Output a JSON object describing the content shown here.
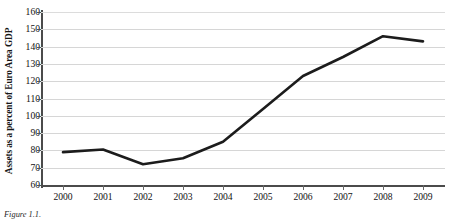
{
  "chart_data": {
    "type": "line",
    "title": "",
    "xlabel": "",
    "ylabel": "Assets as a percent of Euro Area GDP",
    "categories": [
      "2000",
      "2001",
      "2002",
      "2003",
      "2004",
      "2005",
      "2006",
      "2007",
      "2008",
      "2009"
    ],
    "x": [
      2000,
      2001,
      2002,
      2003,
      2004,
      2005,
      2006,
      2007,
      2008,
      2009
    ],
    "values": [
      79,
      80.5,
      72,
      75.5,
      85,
      104,
      123,
      134,
      146,
      143
    ],
    "series": [
      {
        "name": "Assets as a percent of Euro Area GDP",
        "values": [
          79,
          80.5,
          72,
          75.5,
          85,
          104,
          123,
          134,
          146,
          143
        ]
      }
    ],
    "ylim": [
      60,
      160
    ],
    "ytick_labels": [
      "60",
      "70",
      "80",
      "90",
      "100",
      "110",
      "120",
      "130",
      "140",
      "150",
      "160"
    ],
    "ytick_values": [
      60,
      70,
      80,
      90,
      100,
      110,
      120,
      130,
      140,
      150,
      160
    ],
    "xlim": [
      2000,
      2009
    ],
    "grid": "horizontal",
    "legend": "none",
    "line_color": "#1c1c1c",
    "gridline_color": "#d6d6d6",
    "axis_color": "#4b4b4b",
    "background_color": "#ffffff"
  },
  "caption": {
    "label": "Figure 1.1.",
    "text": ""
  }
}
